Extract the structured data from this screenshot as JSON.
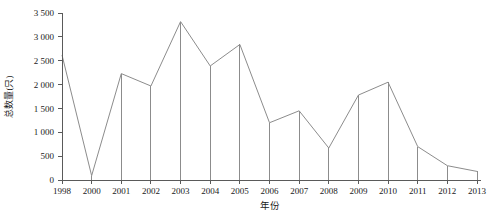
{
  "chart_data": {
    "type": "line",
    "title": "",
    "xlabel": "年份",
    "ylabel": "总数量(只)",
    "categories": [
      "1998",
      "2000",
      "2001",
      "2002",
      "2003",
      "2004",
      "2005",
      "2006",
      "2007",
      "2008",
      "2009",
      "2010",
      "2011",
      "2012",
      "2013"
    ],
    "values": [
      2620,
      90,
      2230,
      1970,
      3320,
      2390,
      2840,
      1200,
      1450,
      670,
      1780,
      2050,
      700,
      300,
      180
    ],
    "ylim": [
      0,
      3500
    ],
    "ytick_labels": [
      "0",
      "500",
      "1 000",
      "1 500",
      "2 000",
      "2 500",
      "3 000",
      "3 500"
    ],
    "ytick_values": [
      0,
      500,
      1000,
      1500,
      2000,
      2500,
      3000,
      3500
    ],
    "grid": false,
    "legend": "none",
    "line_color": "#8c8c8c",
    "axis_color": "#5a5a5a",
    "background": "#ffffff",
    "marker": "none",
    "drop_lines": true
  }
}
